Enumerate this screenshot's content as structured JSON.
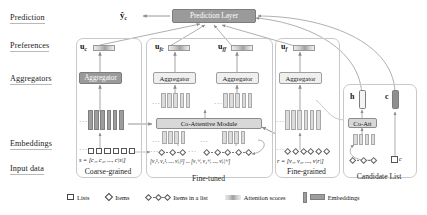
{
  "figure": {
    "type": "architecture-diagram"
  },
  "row_labels": [
    {
      "id": "prediction",
      "label": "Prediction"
    },
    {
      "id": "preferences",
      "label": "Preferences"
    },
    {
      "id": "aggregators",
      "label": "Aggregators"
    },
    {
      "id": "embeddings",
      "label": "Embeddings"
    },
    {
      "id": "input-data",
      "label": "Input data"
    }
  ],
  "prediction": {
    "output_label": "ŷ",
    "output_sub": "c",
    "layer_label": "Prediction Layer"
  },
  "preferences": [
    {
      "id": "uc",
      "base": "u",
      "sub": "c"
    },
    {
      "id": "ufc",
      "base": "u",
      "sub": "fc"
    },
    {
      "id": "uff",
      "base": "u",
      "sub": "ff"
    },
    {
      "id": "uf",
      "base": "u",
      "sub": "f"
    }
  ],
  "aggregators": [
    {
      "id": "agg-coarse",
      "label": "Aggregator",
      "style": "grey"
    },
    {
      "id": "agg-fine-tuned",
      "label": "Aggregator",
      "style": "light"
    },
    {
      "id": "agg-fine-fine",
      "label": "Aggregator",
      "style": "light"
    },
    {
      "id": "agg-fine",
      "label": "Aggregator",
      "style": "light"
    }
  ],
  "modules": {
    "co_attentive": "Co-Attentive Module",
    "co_att": "Co-Att"
  },
  "panels": [
    {
      "id": "coarse-grained",
      "title": "Coarse-grained"
    },
    {
      "id": "fine-tuned",
      "title": "Fine-tuned"
    },
    {
      "id": "fine-grained",
      "title": "Fine-grained"
    },
    {
      "id": "candidate-list",
      "title": "Candidate List"
    }
  ],
  "formulas": {
    "coarse": "s = [c₁, c₂, ..., c|s|]",
    "fine_tuned": "[v₁¹, v₂¹, ..., v|ᵢ|¹] ... [v₁ⁱˢⁱ, v₂ⁱˢⁱ, ..., v|ᵢ|ⁱˢⁱ]",
    "fine": "r = [v₁, v₂, ..., v|r|]"
  },
  "candidate": {
    "h_label": "h",
    "c_label": "c",
    "item_label": "c"
  },
  "legend": [
    {
      "id": "lists",
      "symbol": "square",
      "label": "Lists"
    },
    {
      "id": "items",
      "symbol": "diamond",
      "label": "Items"
    },
    {
      "id": "items-in-a-list",
      "symbol": "chain",
      "label": "Items in a list"
    },
    {
      "id": "attention",
      "symbol": "gradient",
      "label": "Attention scores"
    },
    {
      "id": "embeddings",
      "symbol": "bars",
      "label": "Embeddings"
    }
  ],
  "colors": {
    "grey_fill": "#9a9a9a",
    "light_fill": "#efefef",
    "mid_fill": "#d8d8d8",
    "bar": "#9d9d9d",
    "stroke": "#8d8d8d",
    "panel_border": "#c9c9c9"
  }
}
